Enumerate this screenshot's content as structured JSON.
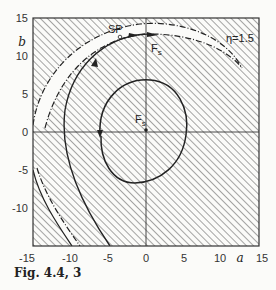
{
  "figure": {
    "caption": "Fig. 4.4, 3",
    "parameter_label": "η=1.5",
    "x_axis": {
      "label": "a",
      "ticks": [
        "-15",
        "-10",
        "-5",
        "0",
        "5",
        "10",
        "15"
      ],
      "range": [
        -15,
        15
      ]
    },
    "y_axis": {
      "label": "b",
      "ticks": [
        "15",
        "10",
        "5",
        "0",
        "-5",
        "-10"
      ],
      "range": [
        -15,
        15
      ]
    },
    "annotations": {
      "saddle_point": "SP",
      "stable_focus_center": "Fs",
      "stable_focus_outer": "Fs"
    },
    "colors": {
      "ink": "#222222",
      "background": "#fbfbf9",
      "hatch": "#3a3a3a"
    }
  }
}
